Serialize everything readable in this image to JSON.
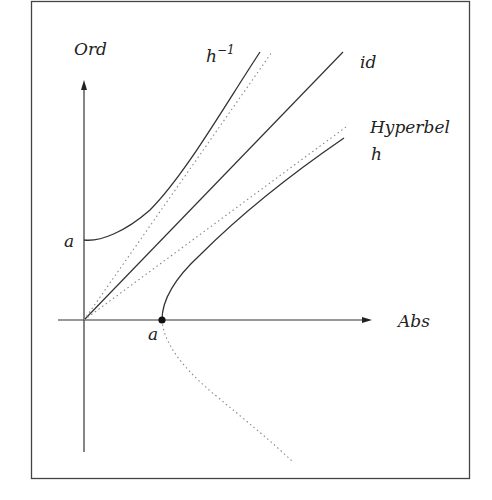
{
  "diagram": {
    "type": "function-graph",
    "labels": {
      "y_axis": "Ord",
      "x_axis": "Abs",
      "inverse": "h",
      "inverse_sup": "−1",
      "identity": "id",
      "hyperbola_title": "Hyperbel",
      "hyperbola_fn": "h",
      "a_on_y": "a",
      "a_on_x": "a"
    },
    "curves": [
      {
        "name": "h",
        "style": "solid",
        "description": "upper branch of hyperbola starting at (a,0)"
      },
      {
        "name": "h^-1",
        "style": "solid",
        "description": "inverse function starting at (0,a)"
      },
      {
        "name": "id",
        "style": "solid",
        "description": "identity line y=x"
      },
      {
        "name": "asymptote-h",
        "style": "dotted"
      },
      {
        "name": "asymptote-h-inverse",
        "style": "dotted"
      },
      {
        "name": "lower-hyperbola-branch",
        "style": "dotted"
      }
    ],
    "colors": {
      "stroke": "#333333",
      "dotted": "#888888",
      "frame": "#444444"
    }
  }
}
